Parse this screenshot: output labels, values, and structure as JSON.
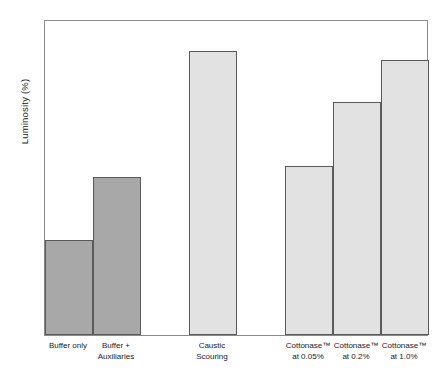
{
  "chart_data": {
    "type": "bar",
    "title": "",
    "xlabel": "",
    "ylabel": "Luminosity (%)",
    "ylim": [
      58,
      68
    ],
    "ytick_step": 1,
    "yticks": [
      "68",
      "67",
      "66",
      "65",
      "64",
      "63",
      "62",
      "61",
      "60",
      "59",
      "58"
    ],
    "grid": false,
    "legend": "none",
    "categories": [
      "Buffer only",
      "Buffer +\nAuxiliaries",
      "Caustic\nScouring",
      "Cottonase™\nat 0.05%",
      "Cottonase™\nat 0.2%",
      "Cottonase™\nat 1.0%"
    ],
    "values": [
      61.0,
      63.0,
      67.0,
      63.35,
      65.38,
      66.7
    ],
    "bars": [
      {
        "label": "Buffer only",
        "value": 61.0,
        "color": "#a8a8a8",
        "slot": 0
      },
      {
        "label": "Buffer +\nAuxiliaries",
        "value": 63.0,
        "color": "#a8a8a8",
        "slot": 1
      },
      {
        "label": "Caustic\nScouring",
        "value": 67.0,
        "color": "#e2e2e2",
        "slot": 3
      },
      {
        "label": "Cottonase™\nat 0.05%",
        "value": 63.35,
        "color": "#e2e2e2",
        "slot": 5
      },
      {
        "label": "Cottonase™\nat 0.2%",
        "value": 65.38,
        "color": "#e2e2e2",
        "slot": 6
      },
      {
        "label": "Cottonase™\nat 1.0%",
        "value": 66.7,
        "color": "#e2e2e2",
        "slot": 7
      }
    ],
    "colors": {
      "bar_dark": "#a8a8a8",
      "bar_light": "#e2e2e2",
      "bar_outline": "#5a5a5a",
      "axis": "#8a8a8a",
      "text": "#1a1a1a",
      "background": "#ffffff"
    }
  }
}
